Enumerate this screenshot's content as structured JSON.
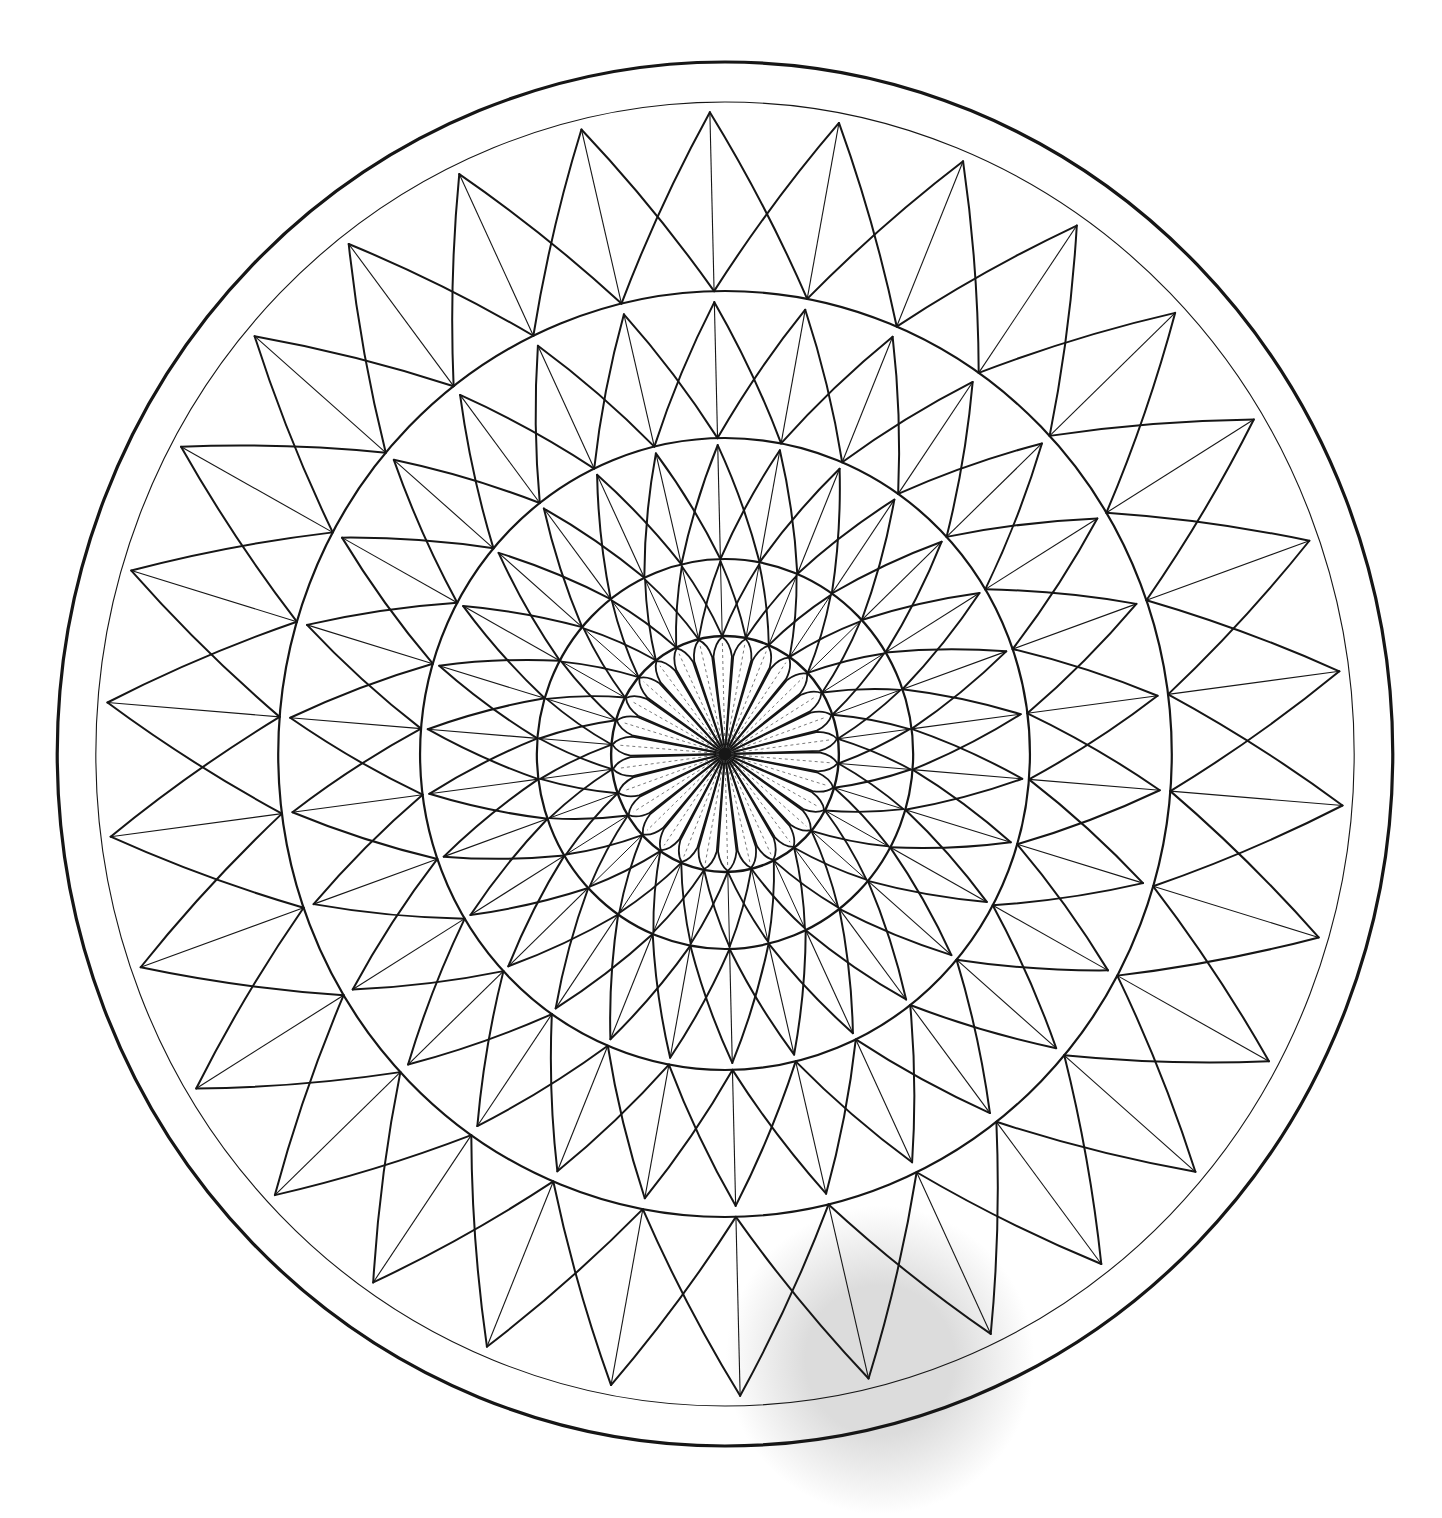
{
  "artwork": {
    "title": "",
    "kind": "geometric mandala line drawing",
    "background": "#ffffff",
    "ink": "#161616",
    "center": {
      "x": 725,
      "y": 754
    },
    "horizontal_scale": 0.965,
    "apex_start_angle_deg": 91.4,
    "symmetry": 30,
    "step_deg": 12,
    "border_circles": [
      {
        "name": "outer-border-circle",
        "r": 692,
        "stroke": 3.2
      },
      {
        "name": "inner-border-circle",
        "r": 652,
        "stroke": 1.1
      }
    ],
    "ring_circles": [
      {
        "name": "ring-circle-a",
        "r": 463,
        "stroke": 2.2
      },
      {
        "name": "ring-circle-b",
        "r": 316,
        "stroke": 2.2
      },
      {
        "name": "ring-circle-c",
        "r": 195,
        "stroke": 2.2
      },
      {
        "name": "center-circle",
        "r": 118,
        "stroke": 2.4
      }
    ],
    "spike_rings": [
      {
        "name": "spike-ring-1",
        "count": 30,
        "apex_r": 642,
        "base_r": 463,
        "leg_span_deg": 12,
        "leg_stroke": 2.0,
        "midline_stroke": 1.1,
        "bow": 0.035
      },
      {
        "name": "spike-ring-2",
        "count": 30,
        "apex_r": 452,
        "base_r": 316,
        "leg_span_deg": 12,
        "leg_stroke": 2.0,
        "midline_stroke": 1.1,
        "bow": 0.04
      },
      {
        "name": "spike-ring-3",
        "count": 30,
        "apex_r": 309,
        "base_r": 195,
        "leg_span_deg": 12,
        "leg_stroke": 2.0,
        "midline_stroke": 1.1,
        "bow": 0.045
      },
      {
        "name": "spike-ring-4",
        "count": 30,
        "apex_r": 193,
        "base_r": 118,
        "leg_span_deg": 12,
        "leg_stroke": 1.9,
        "midline_stroke": 1.0,
        "bow": 0.05
      }
    ],
    "center_rosette": {
      "name": "center-rosette",
      "petal_count": 30,
      "petal_half_width_deg": 5.6,
      "shoulder_r": 98,
      "tip_r": 117,
      "petal_stroke": 1.8,
      "midline_stroke": 0.9,
      "midline_color": "#6a6a6a",
      "hub_r": 6
    },
    "shadow": {
      "x": 880,
      "y": 1360,
      "r": 110,
      "color": "#dcdcdc"
    }
  }
}
